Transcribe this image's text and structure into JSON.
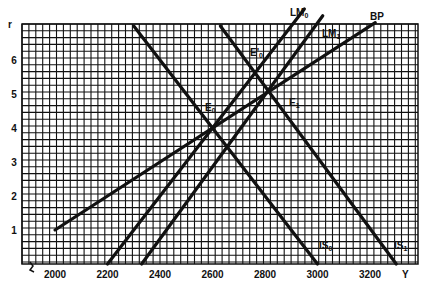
{
  "chart_data": {
    "type": "line",
    "title": "",
    "xlabel": "Y",
    "ylabel": "r",
    "xlim": [
      1880,
      3360
    ],
    "ylim": [
      0,
      7
    ],
    "grid": true,
    "x_ticks": [
      2000,
      2200,
      2400,
      2600,
      2800,
      3000,
      3200
    ],
    "x_tick_labels": [
      "2000",
      "2200",
      "2400",
      "2600",
      "2800",
      "3000",
      "3200"
    ],
    "y_ticks": [
      1,
      2,
      3,
      4,
      5,
      6
    ],
    "y_tick_labels": [
      "1",
      "2",
      "3",
      "4",
      "5",
      "6"
    ],
    "series": [
      {
        "name": "BP",
        "label": "BP",
        "sub": "",
        "points": [
          [
            2000,
            1
          ],
          [
            3220,
            7.1
          ]
        ]
      },
      {
        "name": "LM0",
        "label": "LM",
        "sub": "0",
        "points": [
          [
            2200,
            0
          ],
          [
            2950,
            7.5
          ]
        ]
      },
      {
        "name": "LM1",
        "label": "LM",
        "sub": "1",
        "points": [
          [
            2330,
            0
          ],
          [
            3020,
            7.3
          ]
        ]
      },
      {
        "name": "IS0",
        "label": "IS",
        "sub": "0",
        "points": [
          [
            2300,
            7
          ],
          [
            3000,
            0
          ]
        ]
      },
      {
        "name": "IS1",
        "label": "IS",
        "sub": "1",
        "points": [
          [
            2630,
            7
          ],
          [
            3300,
            0
          ]
        ]
      }
    ],
    "annotations": [
      {
        "text": "E",
        "sub": "0",
        "x": 2600,
        "y": 4
      },
      {
        "text": "E'",
        "sub": "0",
        "x": 2750,
        "y": 5.5
      },
      {
        "text": "E",
        "sub": "1",
        "x": 2800,
        "y": 5
      }
    ],
    "legend": "none"
  },
  "axis": {
    "x_title": "Y",
    "y_title": "r"
  },
  "labels": {
    "bp": "BP",
    "lm0": "LM",
    "lm0_sub": "0",
    "lm1": "LM",
    "lm1_sub": "1",
    "is0": "IS",
    "is0_sub": "0",
    "is1": "IS",
    "is1_sub": "1",
    "e0": "E",
    "e0_sub": "0",
    "e0p": "E'",
    "e0p_sub": "0",
    "e1": "E",
    "e1_sub": "1"
  },
  "colors": {
    "line": "#111111",
    "grid": "#111111",
    "background": "#ffffff"
  }
}
